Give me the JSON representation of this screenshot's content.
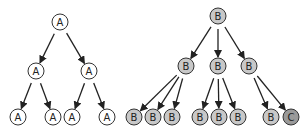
{
  "colors": {
    "node_a_fill": "#ffffff",
    "node_b_fill": "#c8c8c8",
    "node_c_fill": "#9a9a9a",
    "stroke": "#333333",
    "edge": "#222222"
  },
  "trees": [
    {
      "name": "tree-a",
      "nodes": [
        {
          "id": "a0",
          "label": "A",
          "x": 60,
          "y": 22,
          "type": "a"
        },
        {
          "id": "a1",
          "label": "A",
          "x": 36,
          "y": 71,
          "type": "a"
        },
        {
          "id": "a2",
          "label": "A",
          "x": 89,
          "y": 71,
          "type": "a"
        },
        {
          "id": "a3",
          "label": "A",
          "x": 18,
          "y": 117,
          "type": "a"
        },
        {
          "id": "a4",
          "label": "A",
          "x": 53,
          "y": 117,
          "type": "a"
        },
        {
          "id": "a5",
          "label": "A",
          "x": 72,
          "y": 117,
          "type": "a"
        },
        {
          "id": "a6",
          "label": "A",
          "x": 107,
          "y": 117,
          "type": "a"
        }
      ],
      "edges": [
        [
          "a0",
          "a1"
        ],
        [
          "a0",
          "a2"
        ],
        [
          "a1",
          "a3"
        ],
        [
          "a1",
          "a4"
        ],
        [
          "a2",
          "a5"
        ],
        [
          "a2",
          "a6"
        ]
      ]
    },
    {
      "name": "tree-b",
      "nodes": [
        {
          "id": "b0",
          "label": "B",
          "x": 218,
          "y": 16,
          "type": "b"
        },
        {
          "id": "b1",
          "label": "B",
          "x": 186,
          "y": 66,
          "type": "b"
        },
        {
          "id": "b2",
          "label": "B",
          "x": 218,
          "y": 66,
          "type": "b"
        },
        {
          "id": "b3",
          "label": "B",
          "x": 249,
          "y": 66,
          "type": "b"
        },
        {
          "id": "b4",
          "label": "B",
          "x": 134,
          "y": 117,
          "type": "b"
        },
        {
          "id": "b5",
          "label": "B",
          "x": 153,
          "y": 117,
          "type": "b"
        },
        {
          "id": "b6",
          "label": "B",
          "x": 172,
          "y": 117,
          "type": "b"
        },
        {
          "id": "b7",
          "label": "B",
          "x": 200,
          "y": 117,
          "type": "b"
        },
        {
          "id": "b8",
          "label": "B",
          "x": 219,
          "y": 117,
          "type": "b"
        },
        {
          "id": "b9",
          "label": "B",
          "x": 238,
          "y": 117,
          "type": "b"
        },
        {
          "id": "b10",
          "label": "B",
          "x": 271,
          "y": 117,
          "type": "b"
        },
        {
          "id": "c0",
          "label": "C",
          "x": 291,
          "y": 117,
          "type": "c"
        }
      ],
      "edges": [
        [
          "b0",
          "b1"
        ],
        [
          "b0",
          "b2"
        ],
        [
          "b0",
          "b3"
        ],
        [
          "b1",
          "b4"
        ],
        [
          "b1",
          "b5"
        ],
        [
          "b1",
          "b6"
        ],
        [
          "b2",
          "b7"
        ],
        [
          "b2",
          "b8"
        ],
        [
          "b2",
          "b9"
        ],
        [
          "b3",
          "b10"
        ],
        [
          "b3",
          "c0"
        ]
      ]
    }
  ]
}
